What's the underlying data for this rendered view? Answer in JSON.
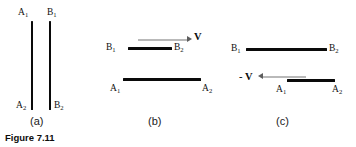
{
  "figure": {
    "caption": "Figure 7.11",
    "panels": [
      {
        "id": "a",
        "caption": "(a)",
        "labels": {
          "a_top": "A",
          "a_top_sub": "1",
          "b_top": "B",
          "b_top_sub": "1",
          "a_bottom": "A",
          "a_bottom_sub": "2",
          "b_bottom": "B",
          "b_bottom_sub": "2"
        }
      },
      {
        "id": "b",
        "caption": "(b)",
        "labels": {
          "b_left": "B",
          "b_left_sub": "1",
          "b_right": "B",
          "b_right_sub": "2",
          "a_left": "A",
          "a_left_sub": "1",
          "a_right": "A",
          "a_right_sub": "2"
        },
        "vector_label": "V",
        "vector_direction": "right"
      },
      {
        "id": "c",
        "caption": "(c)",
        "labels": {
          "b_left": "B",
          "b_left_sub": "1",
          "b_right": "B",
          "b_right_sub": "2",
          "a_left": "A",
          "a_left_sub": "1",
          "a_right": "A",
          "a_right_sub": "2"
        },
        "vector_label": "- V",
        "vector_direction": "left"
      }
    ]
  },
  "colors": {
    "rod": "#0a0a0a",
    "arrow_shaft": "#b9b9b9",
    "arrow_head": "#5d5d5d",
    "text": "#111111",
    "background": "#ffffff"
  }
}
